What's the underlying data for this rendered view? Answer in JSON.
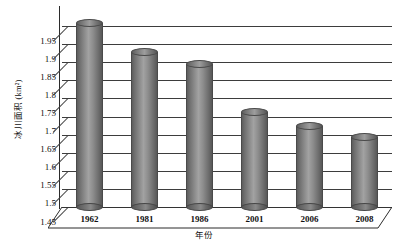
{
  "chart_data": {
    "type": "bar",
    "title": "",
    "subtitle": "",
    "xlabel": "年份",
    "ylabel": "冰川面积 (km²)",
    "categories": [
      "1962",
      "1981",
      "1986",
      "2001",
      "2006",
      "2008"
    ],
    "values": [
      1.97,
      1.89,
      1.855,
      1.725,
      1.685,
      1.655
    ],
    "series": [
      {
        "name": "冰川面积",
        "values": [
          1.97,
          1.89,
          1.855,
          1.725,
          1.685,
          1.655
        ]
      }
    ],
    "ylim": [
      1.45,
      2.0
    ],
    "ytick_labels": [
      "1.95",
      "1.9",
      "1.85",
      "1.8",
      "1.75",
      "1.7",
      "1.65",
      "1.6",
      "1.55",
      "1.5",
      "1.45"
    ],
    "ytick_values": [
      1.95,
      1.9,
      1.85,
      1.8,
      1.75,
      1.7,
      1.65,
      1.6,
      1.55,
      1.5,
      1.45
    ],
    "ytick_step": 0.05,
    "grid": true,
    "grid_axis": "y",
    "legend": false,
    "legend_position": "none",
    "style": "3d-cylinder",
    "bar_color": "#8a8a8a",
    "grid_color": "#3d3d3d",
    "axis_color": "#2b2b2b",
    "background_color": "#ffffff"
  },
  "axes": {
    "y_title": "冰川面积 (km²)",
    "x_title": "年份"
  }
}
